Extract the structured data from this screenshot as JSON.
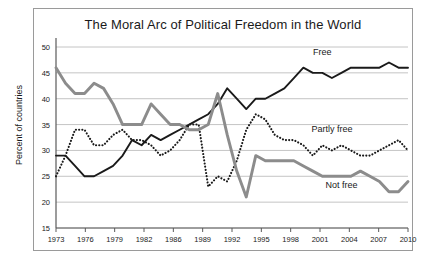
{
  "figure": {
    "title": "The Moral Arc of Political Freedom in the World",
    "ylabel": "Percent of countries"
  },
  "colors": {
    "free": "#1a1a1a",
    "partly_free": "#1a1a1a",
    "not_free": "#8c8c8c",
    "grid": "#b5b5b5",
    "axis": "#5a5a5a",
    "border": "#9a9a9a",
    "background": "#ffffff",
    "text": "#1a1a1a"
  },
  "labels": {
    "free": "Free",
    "partly_free": "Partly free",
    "not_free": "Not free"
  },
  "chart_data": {
    "type": "line",
    "title": "The Moral Arc of Political Freedom in the World",
    "xlabel": "",
    "ylabel": "Percent of countries",
    "xlim": [
      1973,
      2010
    ],
    "ylim": [
      15,
      50
    ],
    "yticks": [
      15,
      20,
      25,
      30,
      35,
      40,
      45,
      50
    ],
    "xticks": [
      1973,
      1976,
      1979,
      1982,
      1986,
      1989,
      1992,
      1995,
      1998,
      2001,
      2004,
      2007,
      2010
    ],
    "grid": true,
    "legend": "inline-annotations",
    "x": [
      1973,
      1974,
      1975,
      1976,
      1977,
      1978,
      1979,
      1980,
      1981,
      1982,
      1983,
      1984,
      1985,
      1986,
      1987,
      1988,
      1989,
      1990,
      1991,
      1992,
      1993,
      1994,
      1995,
      1996,
      1997,
      1998,
      1999,
      2000,
      2001,
      2002,
      2003,
      2004,
      2005,
      2006,
      2007,
      2008,
      2009,
      2010
    ],
    "series": [
      {
        "name": "Free",
        "style": "solid",
        "color": "#1a1a1a",
        "values": [
          29,
          29,
          27,
          25,
          25,
          26,
          27,
          29,
          32,
          31,
          33,
          32,
          33,
          34,
          35,
          36,
          37,
          39,
          42,
          40,
          38,
          40,
          40,
          41,
          42,
          44,
          46,
          45,
          45,
          44,
          45,
          46,
          46,
          46,
          46,
          47,
          46,
          46
        ]
      },
      {
        "name": "Partly free",
        "style": "dotted",
        "color": "#1a1a1a",
        "values": [
          25,
          29,
          34,
          34,
          31,
          31,
          33,
          34,
          32,
          32,
          31,
          29,
          30,
          32,
          35,
          35,
          23,
          25,
          24,
          28,
          34,
          37,
          36,
          33,
          32,
          32,
          31,
          29,
          31,
          30,
          31,
          30,
          29,
          29,
          30,
          31,
          32,
          30
        ]
      },
      {
        "name": "Not free",
        "style": "solid-thick",
        "color": "#8c8c8c",
        "values": [
          46,
          43,
          41,
          41,
          43,
          42,
          39,
          35,
          35,
          35,
          39,
          37,
          35,
          35,
          34,
          34,
          35,
          41,
          33,
          26,
          21,
          29,
          28,
          28,
          28,
          28,
          27,
          26,
          25,
          25,
          25,
          25,
          26,
          25,
          24,
          22,
          22,
          24
        ]
      }
    ],
    "annotations": [
      {
        "text": "Free",
        "x": 2001,
        "y": 48.5
      },
      {
        "text": "Partly free",
        "x": 2002,
        "y": 33.5
      },
      {
        "text": "Not free",
        "x": 2003,
        "y": 22.8
      }
    ]
  }
}
